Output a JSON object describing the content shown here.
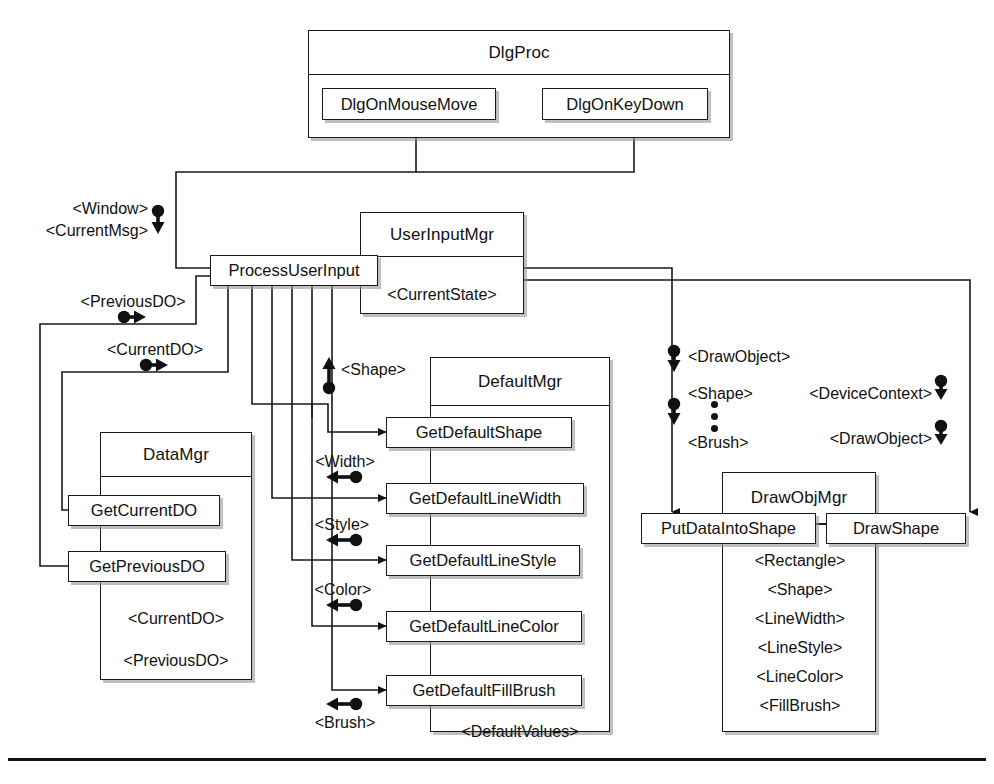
{
  "diagram": {
    "type": "class-interaction-diagram",
    "classes": [
      {
        "id": "dlgproc",
        "name": "DlgProc",
        "operations": [
          "DlgOnMouseMove",
          "DlgOnKeyDown"
        ],
        "attributes": []
      },
      {
        "id": "userinputmgr",
        "name": "UserInputMgr",
        "operations": [
          "ProcessUserInput"
        ],
        "attributes": [
          "<CurrentState>"
        ]
      },
      {
        "id": "datamgr",
        "name": "DataMgr",
        "operations": [
          "GetCurrentDO",
          "GetPreviousDO"
        ],
        "attributes": [
          "<CurrentDO>",
          "<PreviousDO>"
        ]
      },
      {
        "id": "defaultmgr",
        "name": "DefaultMgr",
        "operations": [
          "GetDefaultShape",
          "GetDefaultLineWidth",
          "GetDefaultLineStyle",
          "GetDefaultLineColor",
          "GetDefaultFillBrush"
        ],
        "attributes": [
          "<DefaultValues>"
        ]
      },
      {
        "id": "drawobjmgr",
        "name": "DrawObjMgr",
        "operations": [
          "PutDataIntoShape",
          "DrawShape"
        ],
        "attributes": [
          "<Rectangle>",
          "<Shape>",
          "<LineWidth>",
          "<LineStyle>",
          "<LineColor>",
          "<FillBrush>"
        ]
      }
    ],
    "flow_labels": {
      "window": "<Window>",
      "current_msg": "<CurrentMsg>",
      "previous_do": "<PreviousDO>",
      "current_do": "<CurrentDO>",
      "shape": "<Shape>",
      "width": "<Width>",
      "style": "<Style>",
      "color": "<Color>",
      "brush": "<Brush>",
      "draw_object": "<DrawObject>",
      "shape_right": "<Shape>",
      "brush_right": "<Brush>",
      "device_context": "<DeviceContext>",
      "draw_object2": "<DrawObject>"
    },
    "colors": {
      "line": "#1a1a1a",
      "text": "#111111",
      "background": "#ffffff",
      "shadow": "#8c8c8c"
    }
  }
}
